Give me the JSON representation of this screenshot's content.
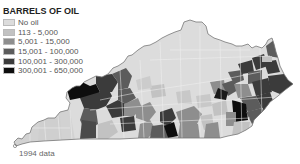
{
  "legend": {
    "title": "BARRELS OF OIL",
    "items": [
      {
        "label": "No oil",
        "color": "#dcdcdc"
      },
      {
        "label": "113 - 5,000",
        "color": "#c2c2c2"
      },
      {
        "label": "5,001 - 15,000",
        "color": "#8e8e8e"
      },
      {
        "label": "15,001 - 100,000",
        "color": "#5c5c5c"
      },
      {
        "label": "100,001 - 300,000",
        "color": "#3b3b3b"
      },
      {
        "label": "300,001 - 650,000",
        "color": "#0e0e0e"
      }
    ]
  },
  "map": {
    "region": "Kentucky counties",
    "outline_color": "#777777",
    "county_border_color": "#f0f0f0"
  },
  "footnote": "1994 data"
}
